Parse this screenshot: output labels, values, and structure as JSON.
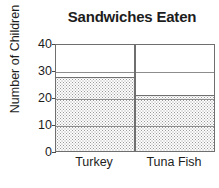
{
  "chart_data": {
    "type": "bar",
    "title": "Sandwiches Eaten",
    "xlabel": "",
    "ylabel": "Number of Children",
    "categories": [
      "Turkey",
      "Tuna Fish"
    ],
    "values": [
      28,
      21
    ],
    "ylim": [
      0,
      40
    ],
    "yticks": [
      0,
      10,
      20,
      30,
      40
    ],
    "ytick_labels": [
      "0",
      "10",
      "20",
      "30",
      "40"
    ],
    "grid": true,
    "legend": false,
    "bar_fill": "stippled-dots",
    "colors": {
      "text": "#1d1d1d",
      "axis": "#6f6f6f",
      "gridline": "#8d8d8d",
      "bar_fill": "#9a9a9a",
      "background": "#ffffff"
    }
  }
}
